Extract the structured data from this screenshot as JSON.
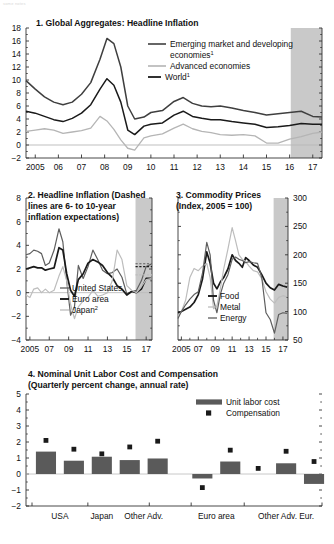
{
  "figure": {
    "faint_header": "some notes",
    "background": "#ffffff"
  },
  "colors": {
    "dark_line": "#1a1a1a",
    "mid_line": "#555555",
    "light_line": "#b5b5b5",
    "shaded_forecast": "#c9c9c9",
    "bar_fill": "#5a5a5a",
    "axis": "#333333"
  },
  "panel1": {
    "title": "1. Global Aggregates: Headline Inflation",
    "legend": [
      {
        "label": "Emerging market and developing economies",
        "sup": "1",
        "color": "#3f3f3f"
      },
      {
        "label": "Advanced economies",
        "sup": "",
        "color": "#b5b5b5"
      },
      {
        "label": "World",
        "sup": "1",
        "color": "#1a1a1a"
      }
    ],
    "yticks": [
      "18",
      "16",
      "14",
      "12",
      "10",
      "8",
      "6",
      "4",
      "2",
      "0",
      "-2"
    ],
    "xticks": [
      "2005",
      "06",
      "07",
      "08",
      "09",
      "10",
      "11",
      "12",
      "13",
      "14",
      "15",
      "16",
      "17"
    ],
    "shade_start_label": "16"
  },
  "panel2": {
    "title": "2. Headline Inflation (Dashed\n    lines are 6- to 10-year\n    inflation expectations)",
    "legend": [
      {
        "label": "United States",
        "sup": "",
        "color": "#5e5e5e"
      },
      {
        "label": "Euro area",
        "sup": "",
        "color": "#1a1a1a"
      },
      {
        "label": "Japan",
        "sup": "2",
        "color": "#bdbdbd"
      }
    ],
    "yticks": [
      "8",
      "6",
      "4",
      "2",
      "0",
      "-2",
      "-4"
    ],
    "xticks": [
      "2005",
      "07",
      "09",
      "11",
      "13",
      "15",
      "17"
    ]
  },
  "panel3": {
    "title": "3. Commodity Prices\n    (Index, 2005 = 100)",
    "legend": [
      {
        "label": "Food",
        "sup": "",
        "color": "#1a1a1a"
      },
      {
        "label": "Metal",
        "sup": "",
        "color": "#bdbdbd"
      },
      {
        "label": "Energy",
        "sup": "",
        "color": "#5e5e5e"
      }
    ],
    "yticks": [
      "300",
      "250",
      "200",
      "150",
      "100",
      "50"
    ],
    "xticks": [
      "2005",
      "07",
      "09",
      "11",
      "13",
      "15",
      "17"
    ]
  },
  "panel4": {
    "title": "4. Nominal Unit Labor Cost and Compensation\n    (Quarterly percent change, annual rate)",
    "legend": [
      {
        "label": "Unit labor cost",
        "marker": "bar",
        "color": "#5a5a5a"
      },
      {
        "label": "Compensation",
        "marker": "square",
        "color": "#1a1a1a"
      }
    ],
    "yticks": [
      "5",
      "4",
      "3",
      "2",
      "1",
      "0",
      "-1",
      "-2"
    ],
    "xticks": [
      "USA",
      "Japan",
      "Other Adv.",
      "Euro area",
      "Other Adv. Eur."
    ]
  },
  "chart_data": [
    {
      "id": "panel1",
      "type": "line",
      "title": "1. Global Aggregates: Headline Inflation",
      "xlabel": "",
      "ylabel": "",
      "ylim": [
        -2,
        18
      ],
      "yticks": [
        -2,
        0,
        2,
        4,
        6,
        8,
        10,
        12,
        14,
        16,
        18
      ],
      "xlim": [
        2004.6,
        2017.4
      ],
      "xticks": [
        2005,
        2006,
        2007,
        2008,
        2009,
        2010,
        2011,
        2012,
        2013,
        2014,
        2015,
        2016,
        2017
      ],
      "xticklabels": [
        "2005",
        "06",
        "07",
        "08",
        "09",
        "10",
        "11",
        "12",
        "13",
        "14",
        "15",
        "16",
        "17"
      ],
      "grid": false,
      "legend_position": "inside-top-right",
      "forecast_shade_from": 2016.05,
      "x": [
        2004.6,
        2005.0,
        2005.4,
        2005.8,
        2006.2,
        2006.6,
        2007.0,
        2007.4,
        2007.8,
        2008.1,
        2008.4,
        2008.7,
        2009.0,
        2009.3,
        2009.7,
        2010.0,
        2010.5,
        2011.0,
        2011.4,
        2011.8,
        2012.2,
        2012.6,
        2013.0,
        2013.5,
        2014.0,
        2014.5,
        2015.0,
        2015.5,
        2016.0,
        2016.5,
        2017.0,
        2017.4
      ],
      "series": [
        {
          "name": "Emerging market and developing economies",
          "color": "#3f3f3f",
          "values": [
            9.9,
            8.6,
            7.4,
            6.6,
            6.2,
            6.6,
            7.8,
            9.6,
            13.2,
            16.4,
            15.6,
            12.0,
            6.0,
            4.0,
            4.3,
            5.0,
            5.3,
            6.7,
            7.3,
            6.4,
            6.0,
            5.9,
            6.0,
            5.7,
            5.3,
            5.0,
            4.6,
            4.8,
            5.0,
            5.2,
            4.4,
            4.3
          ]
        },
        {
          "name": "World",
          "color": "#1a1a1a",
          "values": [
            5.2,
            4.9,
            4.4,
            3.9,
            3.6,
            4.1,
            4.9,
            6.2,
            8.6,
            10.2,
            9.2,
            6.6,
            2.3,
            1.6,
            2.9,
            3.2,
            3.4,
            4.6,
            5.2,
            4.4,
            4.1,
            3.9,
            3.9,
            3.6,
            3.4,
            3.2,
            2.7,
            2.8,
            3.0,
            3.3,
            3.2,
            3.2
          ]
        },
        {
          "name": "Advanced economies",
          "color": "#b5b5b5",
          "values": [
            2.1,
            2.3,
            2.5,
            2.3,
            1.8,
            2.0,
            2.2,
            2.6,
            4.4,
            3.7,
            2.4,
            0.8,
            -0.5,
            -0.8,
            1.1,
            1.4,
            1.7,
            2.6,
            3.2,
            2.5,
            2.1,
            1.9,
            1.6,
            1.5,
            1.6,
            1.4,
            0.3,
            0.3,
            0.9,
            1.3,
            1.8,
            2.0
          ]
        }
      ]
    },
    {
      "id": "panel2",
      "type": "line",
      "title": "2. Headline Inflation (Dashed lines are 6- to 10-year inflation expectations)",
      "ylim": [
        -4,
        8
      ],
      "yticks": [
        -4,
        -2,
        0,
        2,
        4,
        6,
        8
      ],
      "xlim": [
        2004.6,
        2017.6
      ],
      "xticks": [
        2005,
        2007,
        2009,
        2011,
        2013,
        2015,
        2017
      ],
      "xticklabels": [
        "2005",
        "07",
        "09",
        "11",
        "13",
        "15",
        "17"
      ],
      "grid": false,
      "forecast_shade_from": 2015.9,
      "x": [
        2004.6,
        2005.0,
        2005.4,
        2005.8,
        2006.2,
        2006.6,
        2007.0,
        2007.5,
        2008.0,
        2008.4,
        2008.8,
        2009.2,
        2009.6,
        2010.0,
        2010.5,
        2011.0,
        2011.5,
        2012.0,
        2012.5,
        2013.0,
        2013.5,
        2014.0,
        2014.5,
        2015.0,
        2015.5,
        2016.0,
        2016.5,
        2017.0,
        2017.5
      ],
      "series": [
        {
          "name": "United States",
          "color": "#5e5e5e",
          "values": [
            3.2,
            3.3,
            3.6,
            3.5,
            3.3,
            2.3,
            2.5,
            3.6,
            5.4,
            4.3,
            1.0,
            -1.9,
            -1.2,
            2.3,
            1.2,
            2.2,
            3.6,
            2.8,
            1.9,
            1.6,
            1.7,
            2.0,
            1.3,
            -0.1,
            0.1,
            0.2,
            1.0,
            2.2,
            2.4
          ]
        },
        {
          "name": "Euro area",
          "color": "#1a1a1a",
          "values": [
            2.0,
            2.1,
            2.2,
            2.1,
            2.1,
            1.9,
            2.0,
            2.1,
            3.8,
            3.6,
            1.6,
            0.2,
            -0.3,
            1.1,
            1.6,
            2.5,
            2.8,
            2.6,
            2.3,
            1.7,
            1.3,
            0.6,
            0.3,
            -0.2,
            0.1,
            0.0,
            0.3,
            1.2,
            1.2
          ]
        },
        {
          "name": "Japan",
          "color": "#bdbdbd",
          "values": [
            -0.2,
            -0.4,
            0.3,
            0.4,
            0.0,
            0.3,
            0.0,
            0.2,
            1.4,
            2.2,
            1.0,
            -1.0,
            -2.2,
            -1.2,
            -0.7,
            -0.4,
            0.2,
            -0.3,
            -0.2,
            0.0,
            1.0,
            3.6,
            2.8,
            0.6,
            0.2,
            0.0,
            0.5,
            1.1,
            1.2
          ]
        }
      ]
    },
    {
      "id": "panel3",
      "type": "line",
      "title": "3. Commodity Prices (Index, 2005 = 100)",
      "ylim": [
        50,
        300
      ],
      "yticks": [
        50,
        100,
        150,
        200,
        250,
        300
      ],
      "xlim": [
        2004.6,
        2017.6
      ],
      "xticks": [
        2005,
        2007,
        2009,
        2011,
        2013,
        2015,
        2017
      ],
      "xticklabels": [
        "2005",
        "07",
        "09",
        "11",
        "13",
        "15",
        "17"
      ],
      "grid": false,
      "forecast_shade_from": 2015.9,
      "x": [
        2004.6,
        2005.0,
        2005.5,
        2006.0,
        2006.5,
        2007.0,
        2007.5,
        2008.0,
        2008.4,
        2008.8,
        2009.2,
        2009.6,
        2010.0,
        2010.5,
        2011.0,
        2011.4,
        2011.8,
        2012.2,
        2012.6,
        2013.0,
        2013.5,
        2014.0,
        2014.5,
        2015.0,
        2015.5,
        2016.0,
        2016.5,
        2017.0,
        2017.5
      ],
      "series": [
        {
          "name": "Food",
          "color": "#1a1a1a",
          "values": [
            98,
            100,
            104,
            108,
            116,
            130,
            158,
            205,
            185,
            150,
            140,
            152,
            160,
            175,
            200,
            190,
            185,
            178,
            195,
            190,
            182,
            178,
            165,
            150,
            142,
            138,
            148,
            145,
            143
          ]
        },
        {
          "name": "Metal",
          "color": "#bdbdbd",
          "values": [
            92,
            100,
            120,
            160,
            176,
            172,
            180,
            185,
            160,
            105,
            110,
            140,
            175,
            210,
            248,
            225,
            200,
            192,
            188,
            180,
            172,
            170,
            158,
            135,
            122,
            115,
            125,
            128,
            126
          ]
        },
        {
          "name": "Energy",
          "color": "#5e5e5e",
          "values": [
            88,
            100,
            112,
            122,
            130,
            135,
            168,
            222,
            200,
            120,
            98,
            130,
            150,
            165,
            192,
            196,
            192,
            190,
            186,
            188,
            186,
            185,
            160,
            98,
            86,
            62,
            95,
            98,
            97
          ]
        }
      ]
    },
    {
      "id": "panel4",
      "type": "bar",
      "title": "4. Nominal Unit Labor Cost and Compensation (Quarterly percent change, annual rate)",
      "ylim": [
        -2,
        5
      ],
      "yticks": [
        -2,
        -1,
        0,
        1,
        2,
        3,
        4,
        5
      ],
      "grid": false,
      "group_labels": [
        "USA",
        "Japan",
        "Other Adv.",
        "Euro area",
        "Other Adv. Eur."
      ],
      "categories": [
        "c1",
        "c2",
        "c3",
        "c4",
        "c5",
        "c6",
        "c7",
        "c8",
        "c9",
        "c10"
      ],
      "series": [
        {
          "name": "Unit labor cost",
          "type": "bar",
          "color": "#5a5a5a",
          "values": [
            1.4,
            0.83,
            1.08,
            0.87,
            0.97,
            -0.28,
            0.78,
            0.0,
            0.67,
            -0.62
          ]
        },
        {
          "name": "Compensation",
          "type": "scatter",
          "color": "#1a1a1a",
          "values": [
            2.1,
            1.55,
            1.26,
            1.69,
            2.05,
            -0.85,
            1.49,
            0.35,
            1.42,
            0.78
          ]
        }
      ]
    }
  ]
}
